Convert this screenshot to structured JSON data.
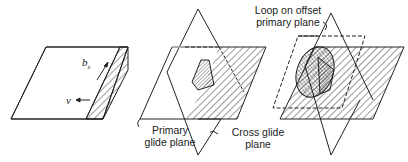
{
  "figure": {
    "panels": [
      {
        "id": "a",
        "description": "Screw dislocation on primary glide plane",
        "labels": {
          "burgers": "b",
          "burgers_sub": "s",
          "velocity": "v"
        }
      },
      {
        "id": "b",
        "description": "Cross slip onto cross glide plane",
        "labels": {
          "primary": "Primary\nglide plane",
          "primary_l1": "Primary",
          "primary_l2": "glide plane",
          "cross_l1": "Cross glide",
          "cross_l2": "plane"
        }
      },
      {
        "id": "c",
        "description": "Loop on offset primary plane",
        "labels": {
          "loop_l1": "Loop on offset",
          "loop_l2": "primary plane"
        }
      }
    ],
    "colors": {
      "line": "#222222",
      "background": "#ffffff"
    }
  }
}
